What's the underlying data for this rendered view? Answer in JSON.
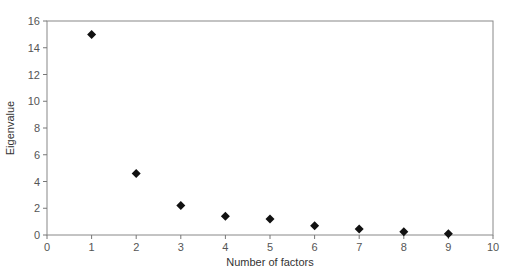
{
  "chart_data": {
    "type": "scatter",
    "title": "",
    "xlabel": "Number of factors",
    "ylabel": "Eigenvalue",
    "xlim": [
      0,
      10
    ],
    "ylim": [
      0,
      16
    ],
    "xticks": [
      0,
      1,
      2,
      3,
      4,
      5,
      6,
      7,
      8,
      9,
      10
    ],
    "yticks": [
      0,
      2,
      4,
      6,
      8,
      10,
      12,
      14,
      16
    ],
    "grid": false,
    "legend": null,
    "marker": "diamond",
    "marker_color": "#111111",
    "x": [
      1,
      2,
      3,
      4,
      5,
      6,
      7,
      8,
      9
    ],
    "y": [
      15.0,
      4.6,
      2.2,
      1.4,
      1.2,
      0.7,
      0.45,
      0.25,
      0.1
    ]
  }
}
